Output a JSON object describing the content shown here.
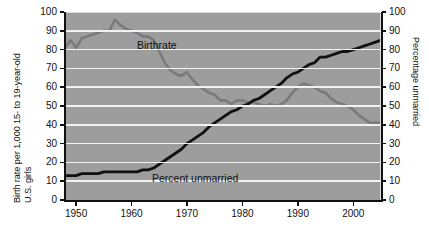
{
  "chart_data": {
    "type": "line",
    "title": "",
    "subtitle": "",
    "xlabel": "",
    "ylabel": "Birth rate per 1,000 15- to 19-year-old U.S. girls",
    "ylabel_line1": "Birth rate per 1,000 15- to 19-year-old",
    "ylabel_line2": "U.S. girls",
    "y2label": "Percentage unmarried",
    "xlim": [
      1948,
      2005
    ],
    "ylim": [
      0,
      100
    ],
    "y2lim": [
      0,
      100
    ],
    "grid": true,
    "grid_axis": "y",
    "legend": "inline-annotations",
    "xticks": [
      1950,
      1960,
      1970,
      1980,
      1990,
      2000
    ],
    "xticklabels": [
      "1950",
      "1960",
      "1970",
      "1980",
      "1990",
      "2000"
    ],
    "yticks": [
      0,
      10,
      20,
      30,
      40,
      50,
      60,
      70,
      80,
      90,
      100
    ],
    "yticklabels": [
      "0",
      "10",
      "20",
      "30",
      "40",
      "50",
      "60",
      "70",
      "80",
      "90",
      "100"
    ],
    "y2ticks": [
      0,
      10,
      20,
      30,
      40,
      50,
      60,
      70,
      80,
      90,
      100
    ],
    "y2ticklabels": [
      "0",
      "10",
      "20",
      "30",
      "40",
      "50",
      "60",
      "70",
      "80",
      "90",
      "100"
    ],
    "plot_background": "#9d9d9d",
    "gridline_color": "#f2f2f2",
    "series": [
      {
        "name": "Birthrate",
        "axis": "left",
        "color": "#7a7a7a",
        "annotation": "Birthrate",
        "x": [
          1948,
          1949,
          1950,
          1951,
          1952,
          1953,
          1954,
          1955,
          1956,
          1957,
          1958,
          1959,
          1960,
          1961,
          1962,
          1963,
          1964,
          1965,
          1966,
          1967,
          1968,
          1969,
          1970,
          1971,
          1972,
          1973,
          1974,
          1975,
          1976,
          1977,
          1978,
          1979,
          1980,
          1981,
          1982,
          1983,
          1984,
          1985,
          1986,
          1987,
          1988,
          1989,
          1990,
          1991,
          1992,
          1993,
          1994,
          1995,
          1996,
          1997,
          1998,
          1999,
          2000,
          2001,
          2002,
          2003,
          2004,
          2005
        ],
        "y": [
          81,
          85,
          81,
          86,
          87,
          88,
          89,
          90,
          90,
          96,
          93,
          91,
          90,
          89,
          87,
          87,
          85,
          79,
          73,
          69,
          67,
          66,
          68,
          64,
          61,
          59,
          57,
          56,
          53,
          53,
          51,
          53,
          53,
          52,
          52,
          51,
          50,
          51,
          50,
          51,
          53,
          57,
          60,
          62,
          61,
          60,
          58,
          57,
          54,
          52,
          51,
          50,
          48,
          45,
          43,
          41,
          41,
          41
        ]
      },
      {
        "name": "Percent unmarried",
        "axis": "right",
        "color": "#111111",
        "annotation": "Percent unmarried",
        "x": [
          1948,
          1949,
          1950,
          1951,
          1952,
          1953,
          1954,
          1955,
          1956,
          1957,
          1958,
          1959,
          1960,
          1961,
          1962,
          1963,
          1964,
          1965,
          1966,
          1967,
          1968,
          1969,
          1970,
          1971,
          1972,
          1973,
          1974,
          1975,
          1976,
          1977,
          1978,
          1979,
          1980,
          1981,
          1982,
          1983,
          1984,
          1985,
          1986,
          1987,
          1988,
          1989,
          1990,
          1991,
          1992,
          1993,
          1994,
          1995,
          1996,
          1997,
          1998,
          1999,
          2000,
          2001,
          2002,
          2003,
          2004,
          2005
        ],
        "y": [
          13,
          13,
          13,
          14,
          14,
          14,
          14,
          15,
          15,
          15,
          15,
          15,
          15,
          15,
          16,
          16,
          17,
          19,
          21,
          23,
          25,
          27,
          30,
          32,
          34,
          36,
          39,
          41,
          43,
          45,
          47,
          48,
          50,
          51,
          53,
          54,
          56,
          58,
          60,
          62,
          65,
          67,
          68,
          70,
          72,
          73,
          76,
          76,
          77,
          78,
          79,
          79,
          80,
          81,
          82,
          83,
          84,
          85
        ]
      }
    ]
  },
  "annotations": {
    "birthrate_label": "Birthrate",
    "unmarried_label": "Percent unmarried"
  }
}
